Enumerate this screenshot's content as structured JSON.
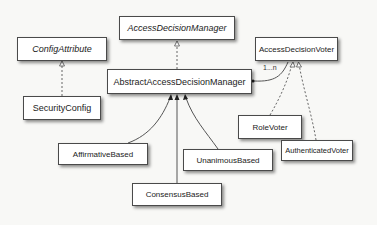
{
  "diagram": {
    "type": "uml-class-diagram",
    "nodes": [
      {
        "id": "access-decision-manager",
        "label": "AccessDecisionManager",
        "kind": "interface"
      },
      {
        "id": "config-attribute",
        "label": "ConfigAttribute",
        "kind": "interface"
      },
      {
        "id": "abstract-access-decision-manager",
        "label": "AbstractAccessDecisionManager",
        "kind": "class"
      },
      {
        "id": "access-decision-voter",
        "label": "AccessDecisionVoter",
        "kind": "class"
      },
      {
        "id": "security-config",
        "label": "SecurityConfig",
        "kind": "class"
      },
      {
        "id": "role-voter",
        "label": "RoleVoter",
        "kind": "class"
      },
      {
        "id": "authenticated-voter",
        "label": "AuthenticatedVoter",
        "kind": "class"
      },
      {
        "id": "affirmative-based",
        "label": "AffirmativeBased",
        "kind": "class"
      },
      {
        "id": "unanimous-based",
        "label": "UnanimousBased",
        "kind": "class"
      },
      {
        "id": "consensus-based",
        "label": "ConsensusBased",
        "kind": "class"
      }
    ],
    "edges": [
      {
        "from": "security-config",
        "to": "config-attribute",
        "type": "realization"
      },
      {
        "from": "abstract-access-decision-manager",
        "to": "access-decision-manager",
        "type": "realization"
      },
      {
        "from": "role-voter",
        "to": "access-decision-voter",
        "type": "realization"
      },
      {
        "from": "authenticated-voter",
        "to": "access-decision-voter",
        "type": "realization"
      },
      {
        "from": "affirmative-based",
        "to": "abstract-access-decision-manager",
        "type": "inheritance"
      },
      {
        "from": "consensus-based",
        "to": "abstract-access-decision-manager",
        "type": "inheritance"
      },
      {
        "from": "unanimous-based",
        "to": "abstract-access-decision-manager",
        "type": "inheritance"
      },
      {
        "from": "abstract-access-decision-manager",
        "to": "access-decision-voter",
        "type": "composition",
        "multiplicity": "1...n"
      }
    ],
    "multiplicity_label": "1...n"
  },
  "colors": {
    "background": "#f8f8f6",
    "box_fill": "#ffffff",
    "box_border": "#4a4a4a",
    "line": "#555555"
  }
}
